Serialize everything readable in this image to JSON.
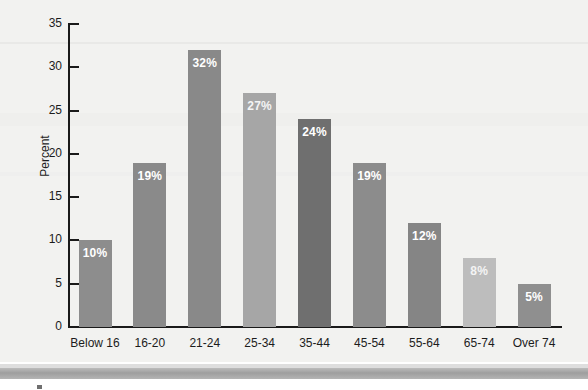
{
  "chart_data": {
    "type": "bar",
    "title": "",
    "xlabel": "",
    "ylabel": "Percent",
    "ylim": [
      0,
      35
    ],
    "ytick_labels": [
      "35",
      "30",
      "25",
      "20",
      "15",
      "10",
      "5",
      "0"
    ],
    "yticks": [
      35,
      30,
      25,
      20,
      15,
      10,
      5,
      0
    ],
    "grid": false,
    "legend": null,
    "categories": [
      "Below 16",
      "16-20",
      "21-24",
      "25-34",
      "35-44",
      "45-54",
      "55-64",
      "65-74",
      "Over 74"
    ],
    "values": [
      10,
      19,
      32,
      27,
      24,
      19,
      12,
      8,
      5
    ],
    "data_labels": [
      "10%",
      "19%",
      "32%",
      "27%",
      "24%",
      "19%",
      "12%",
      "8%",
      "5%"
    ],
    "bar_colors": [
      "#8d8d8d",
      "#8a8a8a",
      "#898989",
      "#a6a6a6",
      "#6f6f6f",
      "#8c8c8c",
      "#858585",
      "#bdbdbd",
      "#8f8f8f"
    ],
    "bars": [
      {
        "category": "Below 16",
        "value": 10,
        "label": "10%",
        "color": "#8d8d8d",
        "label_faint": false
      },
      {
        "category": "16-20",
        "value": 19,
        "label": "19%",
        "color": "#8a8a8a",
        "label_faint": false
      },
      {
        "category": "21-24",
        "value": 32,
        "label": "32%",
        "color": "#898989",
        "label_faint": false
      },
      {
        "category": "25-34",
        "value": 27,
        "label": "27%",
        "color": "#a6a6a6",
        "label_faint": true
      },
      {
        "category": "35-44",
        "value": 24,
        "label": "24%",
        "color": "#6f6f6f",
        "label_faint": false
      },
      {
        "category": "45-54",
        "value": 19,
        "label": "19%",
        "color": "#8c8c8c",
        "label_faint": false
      },
      {
        "category": "55-64",
        "value": 12,
        "label": "12%",
        "color": "#858585",
        "label_faint": false
      },
      {
        "category": "65-74",
        "value": 8,
        "label": "8%",
        "color": "#bdbdbd",
        "label_faint": true
      },
      {
        "category": "Over 74",
        "value": 5,
        "label": "5%",
        "color": "#8f8f8f",
        "label_faint": false
      }
    ]
  },
  "colors": {
    "panel_background": "#f2f2f0",
    "axis": "#1a1a1a",
    "text": "#1c1c1c",
    "footer_band": "#9e9e9e"
  }
}
